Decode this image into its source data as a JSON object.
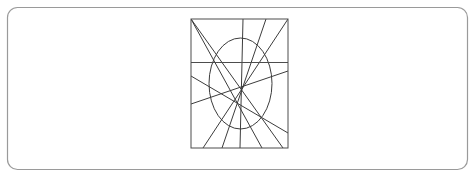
{
  "canvas": {
    "width": 475,
    "height": 177,
    "background_color": "#ffffff",
    "title": "Geometric line-and-ellipse figure"
  },
  "outer_frame": {
    "name": "rounded-rectangle-frame",
    "x": 7.5,
    "y": 7.5,
    "width": 460,
    "height": 162,
    "corner_radius": 10,
    "stroke_color": "#9a9a9a",
    "stroke_width": 1.2,
    "fill": "none"
  },
  "inner_rectangle": {
    "name": "inner-rectangle",
    "x": 191,
    "y": 19,
    "width": 97,
    "height": 129,
    "stroke_color": "#4d4d4d",
    "stroke_width": 1,
    "fill": "none"
  },
  "ellipse": {
    "name": "ellipse",
    "cx": 240.5,
    "cy": 83.5,
    "rx": 31.5,
    "ry": 45.5,
    "stroke_color": "#3c3c3c",
    "stroke_width": 1,
    "fill": "none"
  },
  "horizontal_line": {
    "name": "horizontal-divider-line",
    "x1": 191,
    "y1": 62.5,
    "x2": 288,
    "y2": 62.5,
    "stroke_color": "#4d4d4d",
    "stroke_width": 1
  },
  "diagonal_lines": [
    {
      "name": "diagonal-line-1",
      "x1": 191,
      "y1": 19,
      "x2": 262,
      "y2": 148,
      "stroke_color": "#3c3c3c",
      "stroke_width": 1
    },
    {
      "name": "diagonal-line-2",
      "x1": 191,
      "y1": 19,
      "x2": 283,
      "y2": 148,
      "stroke_color": "#3c3c3c",
      "stroke_width": 1
    },
    {
      "name": "diagonal-line-3",
      "x1": 288,
      "y1": 19,
      "x2": 203,
      "y2": 148,
      "stroke_color": "#3c3c3c",
      "stroke_width": 1
    },
    {
      "name": "diagonal-line-4",
      "x1": 266,
      "y1": 19,
      "x2": 222,
      "y2": 148,
      "stroke_color": "#3c3c3c",
      "stroke_width": 1
    },
    {
      "name": "diagonal-line-5",
      "x1": 243,
      "y1": 19,
      "x2": 240,
      "y2": 148,
      "stroke_color": "#3c3c3c",
      "stroke_width": 1
    },
    {
      "name": "diagonal-line-6",
      "x1": 191,
      "y1": 104,
      "x2": 288,
      "y2": 71,
      "stroke_color": "#3c3c3c",
      "stroke_width": 1
    },
    {
      "name": "diagonal-line-7",
      "x1": 191,
      "y1": 76,
      "x2": 288,
      "y2": 133,
      "stroke_color": "#3c3c3c",
      "stroke_width": 1
    }
  ],
  "counts": {
    "shape_count": 10,
    "line_count": 8,
    "ellipse_count": 1,
    "rectangle_count": 2
  }
}
